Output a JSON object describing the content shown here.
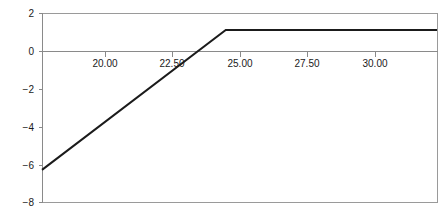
{
  "chart_data": {
    "type": "line",
    "title": "",
    "subtitle": "",
    "xlabel": "",
    "ylabel": "",
    "xlim": [
      18.65,
      32.3
    ],
    "ylim": [
      -8,
      2
    ],
    "grid": false,
    "legend": null,
    "legend_position": "none",
    "x_ticks": [
      20.0,
      22.5,
      25.0,
      27.5,
      30.0
    ],
    "x_tick_labels": [
      "20.00",
      "22.50",
      "25.00",
      "27.50",
      "30.00"
    ],
    "y_ticks": [
      2,
      0,
      -2,
      -4,
      -6,
      -8
    ],
    "y_tick_labels": [
      "2",
      "0",
      "−2",
      "−4",
      "−6",
      "−8"
    ],
    "zero_line": 0,
    "series": [
      {
        "name": "payoff",
        "color": "#1b1b1b",
        "x": [
          18.65,
          25.0,
          32.3
        ],
        "values": [
          -6.3,
          1.1,
          1.1
        ],
        "breakpoint_x": 25.0,
        "plateau_value": 1.1,
        "slope": 1.165,
        "x_intercept": 24.06
      }
    ],
    "frame_color": "#9a9a9a",
    "axis_color": "#8a8a8a",
    "background": "#ffffff"
  },
  "plot_geometry": {
    "left": 42,
    "right": 437,
    "top": 13,
    "bottom": 202,
    "zero_y": 51
  }
}
